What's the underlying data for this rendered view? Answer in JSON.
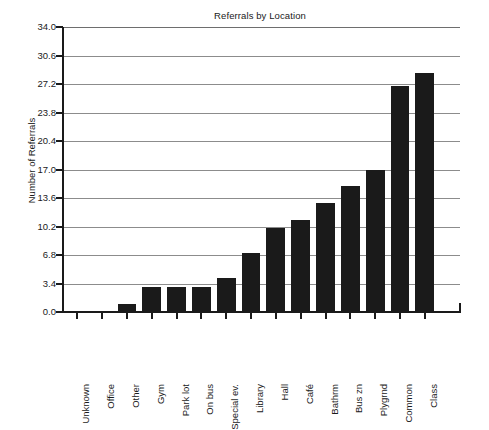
{
  "chart_data": {
    "type": "bar",
    "title": "Referrals by Location",
    "xlabel": "",
    "ylabel": "Number of Referrals",
    "categories": [
      "Unknown",
      "Office",
      "Other",
      "Gym",
      "Park lot",
      "On bus",
      "Special ev.",
      "Library",
      "Hall",
      "Café",
      "Bathrm",
      "Bus zn",
      "Plygrnd",
      "Common",
      "Class"
    ],
    "values": [
      0,
      0,
      1,
      3,
      3,
      3,
      4,
      7,
      10,
      11,
      13,
      15,
      17,
      27,
      28.5
    ],
    "ylim": [
      0,
      34
    ],
    "ytick_values": [
      0,
      3.4,
      6.8,
      10.2,
      13.6,
      17.0,
      20.4,
      23.8,
      27.2,
      30.6,
      34.0
    ],
    "ytick_labels": [
      "0.0",
      "3.4",
      "6.8",
      "10.2",
      "13.6",
      "17.0",
      "20.4",
      "23.8",
      "27.2",
      "30.6",
      "34.0"
    ],
    "grid": true,
    "legend": null,
    "bar_color": "#1a1a1a",
    "background_color": "#ffffff"
  }
}
